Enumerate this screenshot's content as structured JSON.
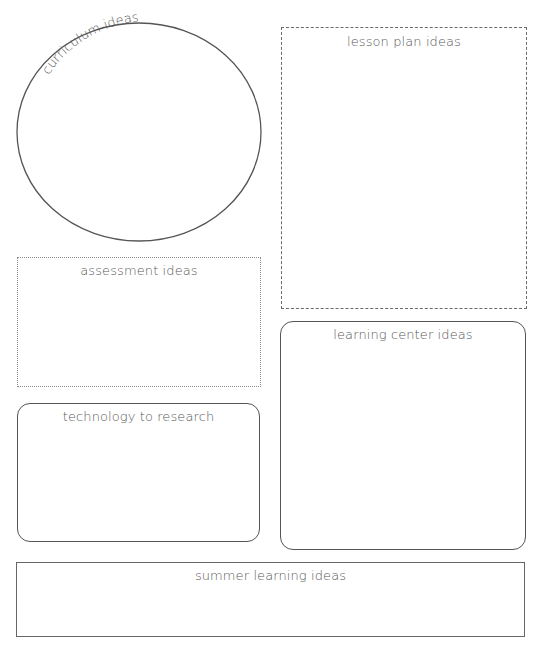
{
  "sections": {
    "curriculum": {
      "label": "curriculum ideas",
      "shape": "ellipse",
      "border": "solid"
    },
    "lesson_plan": {
      "label": "lesson plan ideas",
      "shape": "rectangle",
      "border": "dashed"
    },
    "assessment": {
      "label": "assessment ideas",
      "shape": "rectangle",
      "border": "dotted"
    },
    "learning_center": {
      "label": "learning center ideas",
      "shape": "rounded-rectangle",
      "border": "solid"
    },
    "technology": {
      "label": "technology to research",
      "shape": "rounded-rectangle",
      "border": "solid"
    },
    "summer_learning": {
      "label": "summer learning ideas",
      "shape": "rectangle",
      "border": "solid"
    }
  },
  "colors": {
    "stroke": "#555555",
    "text": "#5a5a5a",
    "background": "#ffffff"
  }
}
